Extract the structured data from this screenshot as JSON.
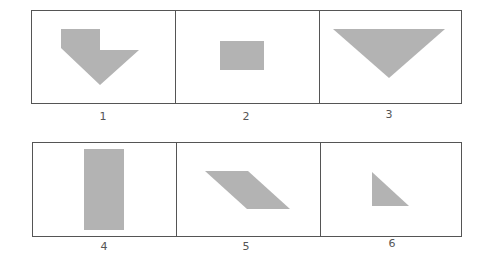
{
  "figure": {
    "rows": [
      {
        "panels": [
          {
            "label": "1",
            "shape": "pentagon-arrow",
            "description": "downward pointing pentagon with notch"
          },
          {
            "label": "2",
            "shape": "rectangle",
            "description": "horizontal rectangle"
          },
          {
            "label": "3",
            "shape": "triangle",
            "description": "downward pointing triangle"
          }
        ]
      },
      {
        "panels": [
          {
            "label": "4",
            "shape": "rectangle",
            "description": "vertical rectangle"
          },
          {
            "label": "5",
            "shape": "parallelogram",
            "description": "slanted parallelogram"
          },
          {
            "label": "6",
            "shape": "right-triangle",
            "description": "small right triangle"
          }
        ]
      }
    ],
    "colors": {
      "shape_fill": "#b3b3b3",
      "frame_stroke": "#555555"
    }
  }
}
